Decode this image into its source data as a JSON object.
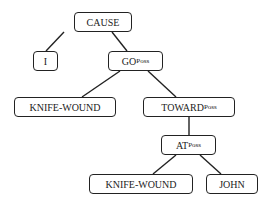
{
  "diagram": {
    "type": "tree",
    "nodes": {
      "cause": {
        "label": "CAUSE",
        "sub": ""
      },
      "i": {
        "label": "I",
        "sub": ""
      },
      "go": {
        "label": "GO",
        "sub": "Poss"
      },
      "kw1": {
        "label": "KNIFE-WOUND",
        "sub": ""
      },
      "toward": {
        "label": "TOWARD",
        "sub": "Poss"
      },
      "at": {
        "label": "AT",
        "sub": "Poss"
      },
      "kw2": {
        "label": "KNIFE-WOUND",
        "sub": ""
      },
      "john": {
        "label": "JOHN",
        "sub": ""
      }
    },
    "edges": [
      [
        "cause",
        "i"
      ],
      [
        "cause",
        "go"
      ],
      [
        "go",
        "kw1"
      ],
      [
        "go",
        "toward"
      ],
      [
        "toward",
        "at"
      ],
      [
        "at",
        "kw2"
      ],
      [
        "at",
        "john"
      ]
    ]
  }
}
